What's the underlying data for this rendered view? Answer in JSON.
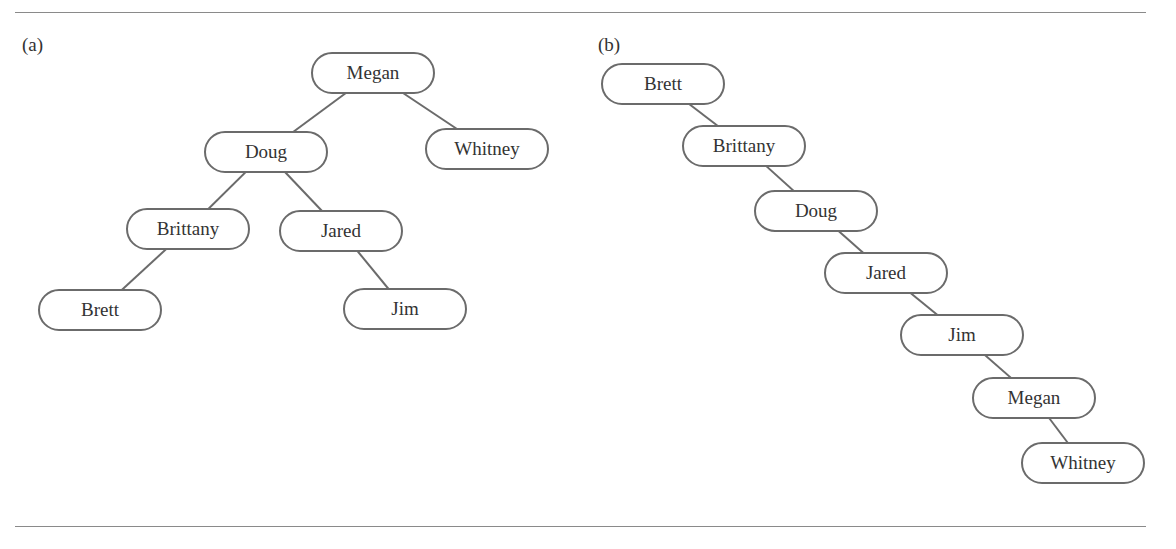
{
  "panels": [
    {
      "label": "(a)",
      "nodes": [
        {
          "name": "Megan",
          "x": 373,
          "y": 73
        },
        {
          "name": "Doug",
          "x": 266,
          "y": 152
        },
        {
          "name": "Whitney",
          "x": 487,
          "y": 149
        },
        {
          "name": "Brittany",
          "x": 188,
          "y": 229
        },
        {
          "name": "Jared",
          "x": 341,
          "y": 231
        },
        {
          "name": "Brett",
          "x": 100,
          "y": 310
        },
        {
          "name": "Jim",
          "x": 405,
          "y": 309
        }
      ],
      "edges": [
        [
          "Megan",
          "Doug"
        ],
        [
          "Megan",
          "Whitney"
        ],
        [
          "Doug",
          "Brittany"
        ],
        [
          "Doug",
          "Jared"
        ],
        [
          "Brittany",
          "Brett"
        ],
        [
          "Jared",
          "Jim"
        ]
      ]
    },
    {
      "label": "(b)",
      "nodes": [
        {
          "name": "Brett",
          "x": 663,
          "y": 84
        },
        {
          "name": "Brittany",
          "x": 744,
          "y": 146
        },
        {
          "name": "Doug",
          "x": 816,
          "y": 211
        },
        {
          "name": "Jared",
          "x": 886,
          "y": 273
        },
        {
          "name": "Jim",
          "x": 962,
          "y": 335
        },
        {
          "name": "Megan",
          "x": 1034,
          "y": 398
        },
        {
          "name": "Whitney",
          "x": 1083,
          "y": 463
        }
      ],
      "edges": [
        [
          "Brett",
          "Brittany"
        ],
        [
          "Brittany",
          "Doug"
        ],
        [
          "Doug",
          "Jared"
        ],
        [
          "Jared",
          "Jim"
        ],
        [
          "Jim",
          "Megan"
        ],
        [
          "Megan",
          "Whitney"
        ]
      ]
    }
  ]
}
